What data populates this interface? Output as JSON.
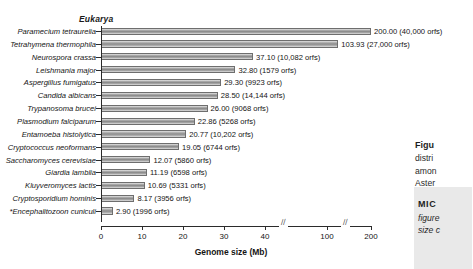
{
  "figure": {
    "group_header": "Eukarya",
    "xaxis_title": "Genome size (Mb)",
    "axis_break_glyph": "//"
  },
  "chart_data": {
    "type": "bar",
    "orientation": "horizontal",
    "title": "Eukarya",
    "xlabel": "Genome size (Mb)",
    "ylabel": "",
    "xlim": [
      0,
      200
    ],
    "xticks": [
      0,
      10,
      20,
      30,
      40,
      100,
      200
    ],
    "xtick_labels": [
      "0",
      "10",
      "20",
      "30",
      "40",
      "100",
      "200"
    ],
    "axis_breaks": [
      [
        40,
        100
      ],
      [
        100,
        200
      ]
    ],
    "grid": false,
    "legend": null,
    "unit": "Mb",
    "categories": [
      "Paramecium tetraurelia",
      "Tetrahymena thermophila",
      "Neurospora crassa",
      "Leishmania major",
      "Aspergillus fumigatus",
      "Candida albicans",
      "Trypanosoma brucei",
      "Plasmodium falciparum",
      "Entamoeba histolytica",
      "Cryptococcus neoformans",
      "Saccharomyces cerevisiae",
      "Giardia lamblia",
      "Kluyveromyces lactis",
      "Cryptosporidium hominis",
      "*Encephalitozoon cuniculi"
    ],
    "values": [
      200.0,
      103.93,
      37.1,
      32.8,
      29.3,
      28.5,
      26.0,
      22.86,
      20.77,
      19.05,
      12.07,
      11.19,
      10.69,
      8.17,
      2.9
    ],
    "orfs": [
      40000,
      27000,
      10082,
      1579,
      9923,
      14144,
      9068,
      5268,
      10202,
      6744,
      5860,
      6598,
      5331,
      3956,
      1996
    ],
    "data_labels": [
      "200.00 (40,000 orfs)",
      "103.93 (27,000 orfs)",
      "37.10 (10,082 orfs)",
      "32.80 (1579 orfs)",
      "29.30 (9923 orfs)",
      "28.50 (14,144 orfs)",
      "26.00 (9068 orfs)",
      "22.86 (5268 orfs)",
      "20.77 (10,202 orfs)",
      "19.05 (6744 orfs)",
      "12.07 (5860 orfs)",
      "11.19 (6598 orfs)",
      "10.69 (5331 orfs)",
      "8.17 (3956 orfs)",
      "2.90 (1996 orfs)"
    ]
  },
  "caption": {
    "fig_label": "Figu",
    "line1": "distri",
    "line2": "amon",
    "line3": "Aster",
    "mic_label": "MIC",
    "ital1": "figure",
    "ital2": "size c"
  },
  "colors": {
    "bar_fill_light": "#d8d8d8",
    "bar_fill_dark": "#8d8d8d",
    "bar_border": "#6e6e6e",
    "axis": "#2b2b2b",
    "text": "#141414",
    "caption_shade": "#e9e9e9",
    "background": "#ffffff"
  }
}
